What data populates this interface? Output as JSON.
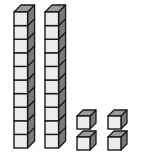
{
  "diagram": {
    "represents": 24,
    "tens_rods": {
      "count": 2,
      "cubes_per_rod": 10
    },
    "unit_cubes": {
      "count": 4,
      "arrangement": "2x2 grid"
    },
    "colors": {
      "front": "#ececec",
      "top": "#9a9a9a",
      "side": "#7a7a7a",
      "outline": "#1a1a1a",
      "background": "#ffffff"
    }
  }
}
